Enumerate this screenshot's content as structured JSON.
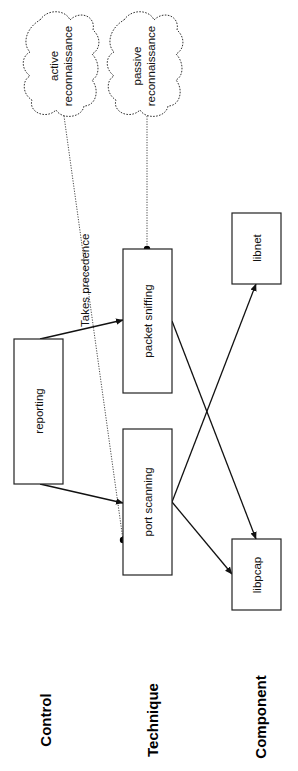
{
  "diagram": {
    "orientation": "rotated-90-ccw",
    "row_labels": {
      "control": "Control",
      "technique": "Technique",
      "component": "Component"
    },
    "nodes": {
      "reporting": {
        "label": "reporting",
        "row": "Control",
        "shape": "rectangle"
      },
      "packet_sniffing": {
        "label": "packet sniffing",
        "row": "Technique",
        "shape": "rectangle"
      },
      "port_scanning": {
        "label": "port scanning",
        "row": "Technique",
        "shape": "rectangle"
      },
      "libnet": {
        "label": "libnet",
        "row": "Component",
        "shape": "rectangle"
      },
      "libpcap": {
        "label": "libpcap",
        "row": "Component",
        "shape": "rectangle"
      },
      "active_recon": {
        "label_line1": "active",
        "label_line2": "reconnaissance",
        "shape": "cloud"
      },
      "passive_recon": {
        "label_line1": "passive",
        "label_line2": "reconnaissance",
        "shape": "cloud"
      }
    },
    "edges": [
      {
        "from": "reporting",
        "to": "packet_sniffing",
        "style": "solid-arrow"
      },
      {
        "from": "reporting",
        "to": "port_scanning",
        "style": "solid-arrow"
      },
      {
        "from": "packet_sniffing",
        "to": "libpcap",
        "style": "solid-arrow"
      },
      {
        "from": "port_scanning",
        "to": "libpcap",
        "style": "solid-arrow"
      },
      {
        "from": "port_scanning",
        "to": "libnet",
        "style": "solid-arrow"
      },
      {
        "from": "active_recon",
        "to": "port_scanning",
        "style": "dotted-dot"
      },
      {
        "from": "passive_recon",
        "to": "packet_sniffing",
        "style": "dotted-dot"
      }
    ],
    "edge_label": "Takes precedence"
  }
}
